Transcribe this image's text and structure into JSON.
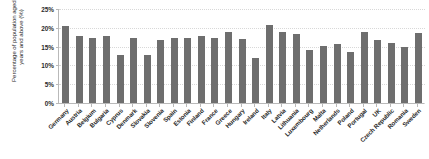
{
  "chart_data": {
    "type": "bar",
    "title": "",
    "xlabel": "",
    "ylabel": "Percentage of population aged 65 years and above (%)",
    "ylim": [
      0,
      25
    ],
    "ytick_labels": [
      "0%",
      "5%",
      "10%",
      "15%",
      "20%",
      "25%"
    ],
    "ytick_values": [
      0,
      5,
      10,
      15,
      20,
      25
    ],
    "grid": true,
    "legend": "none",
    "bar_color": "#6e6e6e",
    "categories": [
      "Germany",
      "Austria",
      "Belgium",
      "Bulgaria",
      "Cyprus",
      "Denmark",
      "Slovakia",
      "Slovenia",
      "Spain",
      "Estonia",
      "Finland",
      "France",
      "Greece",
      "Hungary",
      "Ireland",
      "Italy",
      "Latvia",
      "Lithuania",
      "Luxembourg",
      "Malta",
      "Netherlands",
      "Poland",
      "Portugal",
      "UK",
      "Czech Republic",
      "Romania",
      "Sweden"
    ],
    "values": [
      20.6,
      17.8,
      17.4,
      17.8,
      12.8,
      17.3,
      12.8,
      16.8,
      17.4,
      17.4,
      17.8,
      17.2,
      19.0,
      17.0,
      11.9,
      20.8,
      19.0,
      18.4,
      14.0,
      15.2,
      15.8,
      13.5,
      19.0,
      16.8,
      16.0,
      14.9,
      18.5
    ]
  }
}
